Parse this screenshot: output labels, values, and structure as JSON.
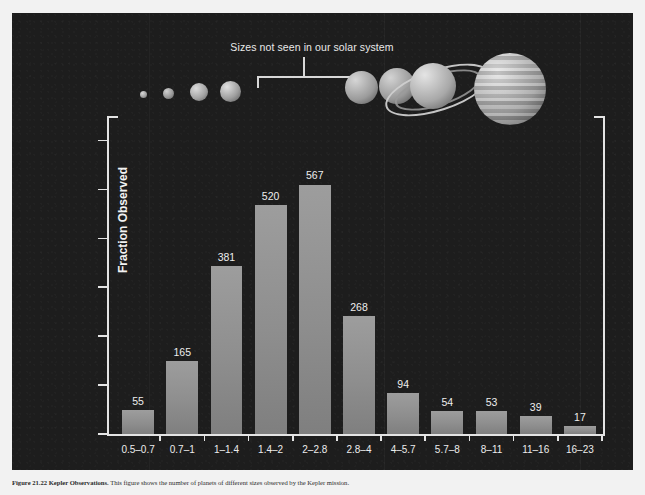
{
  "figure": {
    "background_color": "#1d1d1d",
    "annotation": {
      "text": "Sizes not seen in our solar system",
      "bracket_icon": "bracket-down-icon"
    },
    "planets": [
      {
        "name": "Mercury",
        "icon": "planet-mercury-icon"
      },
      {
        "name": "Mars",
        "icon": "planet-mars-icon"
      },
      {
        "name": "Venus",
        "icon": "planet-venus-icon"
      },
      {
        "name": "Earth",
        "icon": "planet-earth-icon"
      },
      {
        "name": "Uranus",
        "icon": "planet-uranus-icon"
      },
      {
        "name": "Neptune",
        "icon": "planet-neptune-icon"
      },
      {
        "name": "Saturn",
        "icon": "planet-saturn-icon"
      },
      {
        "name": "Jupiter",
        "icon": "planet-jupiter-icon"
      }
    ]
  },
  "chart_data": {
    "type": "bar",
    "title": "",
    "xlabel": "Planet Size (Earth = 1)",
    "ylabel": "Fraction Observed",
    "categories": [
      "0.5–0.7",
      "0.7–1",
      "1–1.4",
      "1.4–2",
      "2–2.8",
      "2.8–4",
      "4–5.7",
      "5.7–8",
      "8–11",
      "11–16",
      "16–23"
    ],
    "values": [
      0.025,
      0.075,
      0.172,
      0.234,
      0.255,
      0.121,
      0.042,
      0.024,
      0.024,
      0.018,
      0.008
    ],
    "counts": [
      55,
      165,
      381,
      520,
      567,
      268,
      94,
      54,
      53,
      39,
      17
    ],
    "bar_labels": [
      "55",
      "165",
      "381",
      "520",
      "567",
      "268",
      "94",
      "54",
      "53",
      "39",
      "17"
    ],
    "ylim": [
      0,
      0.325
    ],
    "ytick_values": [
      0,
      0.05,
      0.1,
      0.15,
      0.2,
      0.25,
      0.3
    ],
    "ytick_labels": [
      "0",
      "0.05",
      "0.1",
      "0.15",
      "0.2",
      "0.25",
      "0.3"
    ],
    "grid": false,
    "legend": "none",
    "bar_color": "#8e8e8e",
    "axis_color": "#e4e4e4",
    "text_color": "#ececec",
    "annotations": [
      {
        "text": "Sizes not seen in our solar system",
        "span_categories": [
          "1.4–2",
          "2–2.8"
        ]
      }
    ]
  },
  "caption": {
    "lead": "Figure 21.22",
    "title": "Kepler Observations.",
    "body": "This figure shows the number of planets of different sizes observed by the Kepler mission."
  }
}
